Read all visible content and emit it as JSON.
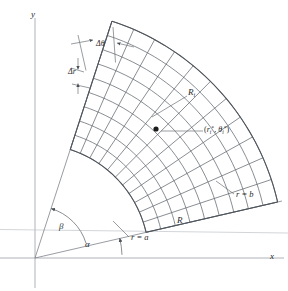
{
  "figure": {
    "type": "polar-region-diagram",
    "background_color": "#ffffff",
    "line_color": "#5a5f66",
    "axis_color": "#8d939a",
    "text_color": "#2a2a2a"
  },
  "axes": {
    "y_label": "y",
    "x_label": "x",
    "origin_px": [
      35,
      258
    ]
  },
  "labels": {
    "delta_theta": "Δθ",
    "delta_r": "Δr",
    "subregion": "R",
    "subregion_sub": "i",
    "sample_point_open": "(",
    "sample_point_r": "r",
    "sample_point_r_sub": "i",
    "sample_point_star1": "*",
    "sample_point_comma": ", ",
    "sample_point_theta": "θ",
    "sample_point_theta_sub": "i",
    "sample_point_star2": "*",
    "sample_point_close": ")",
    "r_equals_b": "r = b",
    "r_equals_a": "r = a",
    "region": "R",
    "angle_alpha": "α",
    "angle_beta": "β"
  },
  "chart_data": {
    "type": "diagram",
    "geometry": {
      "origin": [
        35,
        258
      ],
      "inner_radius_px": 114,
      "outer_radius_px": 249,
      "angle_alpha_deg": 13,
      "angle_beta_deg": 72,
      "radial_divisions": 9,
      "angular_divisions": 11,
      "sample_point_px": [
        156,
        129
      ]
    },
    "annotations": [
      {
        "name": "delta-theta",
        "text": "Δθ"
      },
      {
        "name": "delta-r",
        "text": "Δr"
      },
      {
        "name": "subregion-Ri",
        "text": "Rᵢ"
      },
      {
        "name": "sample-point",
        "text": "(rᵢ*, θᵢ*)"
      },
      {
        "name": "outer-boundary",
        "text": "r = b"
      },
      {
        "name": "inner-boundary",
        "text": "r = a"
      },
      {
        "name": "region",
        "text": "R"
      },
      {
        "name": "alpha",
        "text": "α"
      },
      {
        "name": "beta",
        "text": "β"
      }
    ]
  }
}
